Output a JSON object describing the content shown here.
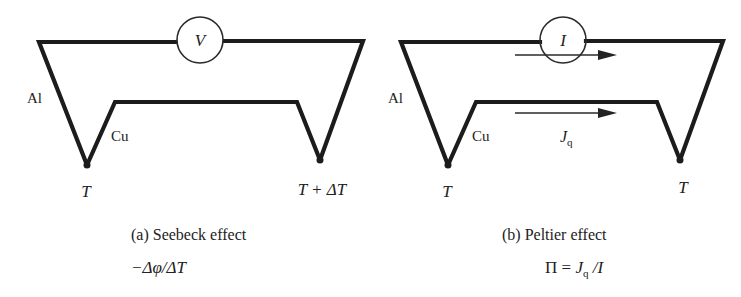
{
  "figure": {
    "panels": [
      {
        "id": "a",
        "caption": "(a) Seebeck effect",
        "formula": "−Δφ/ΔT",
        "meter_symbol": "V",
        "wire_labels": {
          "outer": "Al",
          "inner": "Cu"
        },
        "junction_labels": {
          "left": "T",
          "right": "T + ΔT"
        }
      },
      {
        "id": "b",
        "caption": "(b) Peltier effect",
        "formula_parts": {
          "lhs": "Π = ",
          "j": "J",
          "sub": "q",
          "rest": " /I"
        },
        "meter_symbol": "I",
        "wire_labels": {
          "outer": "Al",
          "inner": "Cu"
        },
        "junction_labels": {
          "left": "T",
          "right": "T"
        },
        "flow_label": {
          "j": "J",
          "sub": "q"
        }
      }
    ],
    "colors": {
      "line": "#1c1c1c",
      "background": "#ffffff"
    }
  }
}
